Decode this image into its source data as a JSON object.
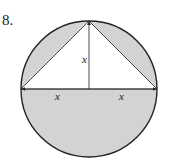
{
  "problem": {
    "number": "8."
  },
  "diagram": {
    "type": "circle-with-inscribed-triangle",
    "labels": {
      "height": "x",
      "left_half": "x",
      "right_half": "x"
    },
    "colors": {
      "shade": "#d3d3d3",
      "stroke": "#222222",
      "background": "#ffffff"
    }
  }
}
